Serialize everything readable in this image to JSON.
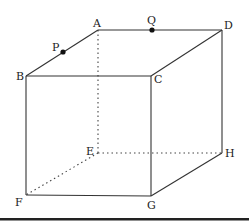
{
  "diagram": {
    "type": "cube",
    "vertices": {
      "A": {
        "label": "A",
        "x": 98,
        "y": 30
      },
      "B": {
        "label": "B",
        "x": 26,
        "y": 76
      },
      "C": {
        "label": "C",
        "x": 151,
        "y": 76
      },
      "D": {
        "label": "D",
        "x": 222,
        "y": 30
      },
      "E": {
        "label": "E",
        "x": 98,
        "y": 153
      },
      "F": {
        "label": "F",
        "x": 26,
        "y": 195
      },
      "G": {
        "label": "G",
        "x": 151,
        "y": 196
      },
      "H": {
        "label": "H",
        "x": 222,
        "y": 153
      }
    },
    "points": {
      "P": {
        "label": "P",
        "on_edge": "AB",
        "x": 63,
        "y": 52
      },
      "Q": {
        "label": "Q",
        "on_edge": "AD",
        "x": 152,
        "y": 30
      }
    },
    "visible_edges": [
      "AB",
      "AD",
      "BC",
      "CD",
      "BF",
      "CG",
      "DH",
      "FG",
      "GH"
    ],
    "hidden_edges": [
      "AE",
      "EF",
      "EH"
    ],
    "colors": {
      "line": "#333333",
      "point": "#111111",
      "background": "#ffffff",
      "rule": "#222222"
    }
  }
}
